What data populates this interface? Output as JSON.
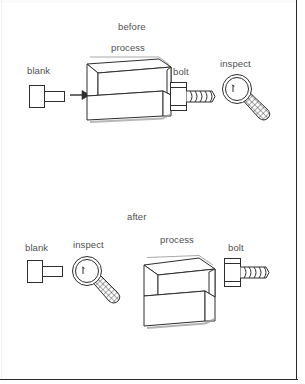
{
  "figure": {
    "kind": "line-art-process-diagram",
    "page_frame": {
      "border_color": "#2b2b2b",
      "background": "#ffffff"
    },
    "ink_color": "#2e2e2e",
    "label_color": "#4f4f4f",
    "shadow_color": "#9a9a9a"
  },
  "panels": [
    {
      "id": "before",
      "title": "before",
      "items": [
        {
          "id": "blank",
          "label": "blank",
          "icon": "blank-workpiece-icon"
        },
        {
          "id": "arrow",
          "label": "",
          "icon": "right-arrow-icon"
        },
        {
          "id": "process",
          "label": "process",
          "icon": "process-machine-box-icon"
        },
        {
          "id": "bolt",
          "label": "bolt",
          "icon": "bolt-icon"
        },
        {
          "id": "inspect",
          "label": "inspect",
          "icon": "magnifying-glass-icon"
        }
      ]
    },
    {
      "id": "after",
      "title": "after",
      "items": [
        {
          "id": "blank",
          "label": "blank",
          "icon": "blank-workpiece-icon"
        },
        {
          "id": "inspect",
          "label": "inspect",
          "icon": "magnifying-glass-icon"
        },
        {
          "id": "process",
          "label": "process",
          "icon": "process-machine-box-icon"
        },
        {
          "id": "bolt",
          "label": "bolt",
          "icon": "bolt-icon"
        }
      ]
    }
  ],
  "cropped_text_above": {
    "fragment_1": "",
    "fragment_2": "",
    "fragment_3": "",
    "fragment_4": ""
  }
}
